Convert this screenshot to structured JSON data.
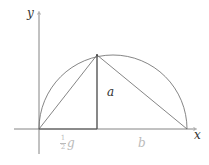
{
  "diagram": {
    "type": "semicircle-geometric-mean",
    "labels": {
      "y_axis": "y",
      "x_axis": "x",
      "height": "a",
      "left_segment_num": "1",
      "left_segment_den": "2",
      "left_segment_var": "g",
      "right_segment": "b"
    },
    "colors": {
      "stroke": "#555555",
      "axis": "#666666",
      "faded_label": "#bbbbbb"
    }
  }
}
